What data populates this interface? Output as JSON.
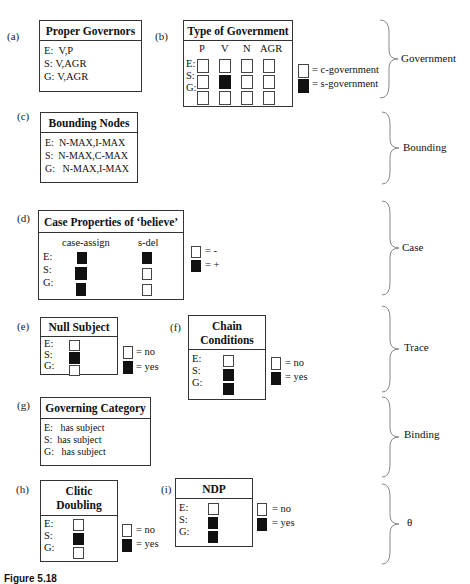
{
  "panels": {
    "a": {
      "label": "(a)",
      "title": "Proper Governors",
      "rows": [
        {
          "k": "E:",
          "v": "V,P"
        },
        {
          "k": "S:",
          "v": "V,AGR"
        },
        {
          "k": "G:",
          "v": "V,AGR"
        }
      ]
    },
    "b": {
      "label": "(b)",
      "title": "Type of Government",
      "columns": [
        "P",
        "V",
        "N",
        "AGR"
      ],
      "row_labels": [
        "E:",
        "S:",
        "G:"
      ],
      "grid": [
        [
          false,
          false,
          false,
          false
        ],
        [
          false,
          true,
          false,
          false
        ],
        [
          false,
          false,
          false,
          false
        ]
      ],
      "legend": {
        "empty": "= c-government",
        "filled": "= s-government"
      }
    },
    "c": {
      "label": "(c)",
      "title": "Bounding Nodes",
      "rows": [
        {
          "k": "E:",
          "v": "N-MAX,I-MAX"
        },
        {
          "k": "S:",
          "v": "N-MAX,C-MAX"
        },
        {
          "k": "G:",
          "v": "N-MAX,I-MAX"
        }
      ]
    },
    "d": {
      "label": "(d)",
      "title": "Case Properties of ‘believe’",
      "columns": [
        "case-assign",
        "s-del"
      ],
      "row_labels": [
        "E:",
        "S:",
        "G:"
      ],
      "grid": [
        [
          true,
          true
        ],
        [
          true,
          false
        ],
        [
          true,
          false
        ]
      ],
      "legend": {
        "empty": "=  -",
        "filled": "=  +"
      }
    },
    "e": {
      "label": "(e)",
      "title": "Null Subject",
      "row_labels": [
        "E:",
        "S:",
        "G:"
      ],
      "values": [
        false,
        true,
        false
      ],
      "legend": {
        "empty": "= no",
        "filled": "=  yes"
      }
    },
    "f": {
      "label": "(f)",
      "title_line1": "Chain",
      "title_line2": "Conditions",
      "row_labels": [
        "E:",
        "S:",
        "G:"
      ],
      "values": [
        false,
        true,
        true
      ],
      "legend": {
        "empty": "= no",
        "filled": "=  yes"
      }
    },
    "g": {
      "label": "(g)",
      "title": "Governing Category",
      "rows": [
        {
          "k": "E:",
          "v": "has subject"
        },
        {
          "k": "S:",
          "v": "has subject"
        },
        {
          "k": "G:",
          "v": "has subject"
        }
      ]
    },
    "h": {
      "label": "(h)",
      "title_line1": "Clitic",
      "title_line2": "Doubling",
      "row_labels": [
        "E:",
        "S:",
        "G:"
      ],
      "values": [
        false,
        true,
        false
      ],
      "legend": {
        "empty": "= no",
        "filled": "=  yes"
      }
    },
    "i": {
      "label": "(i)",
      "title": "NDP",
      "row_labels": [
        "E:",
        "S:",
        "G:"
      ],
      "values": [
        false,
        true,
        true
      ],
      "legend": {
        "empty": "= no",
        "filled": "=  yes"
      }
    }
  },
  "braces": {
    "government": "Government",
    "bounding": "Bounding",
    "case": "Case",
    "trace": "Trace",
    "binding": "Binding",
    "theta": "θ"
  },
  "caption": "Figure 5.18"
}
